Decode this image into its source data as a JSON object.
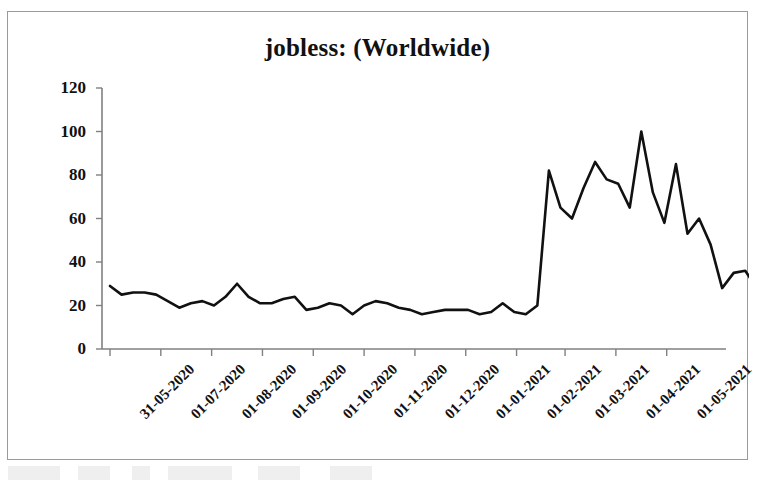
{
  "chart_data": {
    "type": "line",
    "title": "jobless: (Worldwide)",
    "xlabel": "",
    "ylabel": "",
    "ylim": [
      0,
      120
    ],
    "yticks": [
      0,
      20,
      40,
      60,
      80,
      100,
      120
    ],
    "grid": false,
    "legend": "none",
    "line_color": "#111111",
    "xtick_labels": [
      "31-05-2020",
      "01-07-2020",
      "01-08-2020",
      "01-09-2020",
      "01-10-2020",
      "01-11-2020",
      "01-12-2020",
      "01-01-2021",
      "01-02-2021",
      "01-03-2021",
      "01-04-2021",
      "01-05-2021"
    ],
    "xtick_positions": [
      0,
      4.4,
      8.8,
      13.2,
      17.6,
      22.0,
      26.4,
      30.8,
      35.2,
      39.4,
      43.8,
      48.2
    ],
    "x_index": [
      0,
      1,
      2,
      3,
      4,
      5,
      6,
      7,
      8,
      9,
      10,
      11,
      12,
      13,
      14,
      15,
      16,
      17,
      18,
      19,
      20,
      21,
      22,
      23,
      24,
      25,
      26,
      27,
      28,
      29,
      30,
      31,
      32,
      33,
      34,
      35,
      36,
      37,
      38,
      39,
      40,
      41,
      42,
      43,
      44,
      45,
      46,
      47,
      48,
      49,
      50,
      51,
      52,
      53
    ],
    "series": [
      {
        "name": "jobless",
        "values": [
          29,
          25,
          26,
          26,
          25,
          22,
          19,
          21,
          22,
          20,
          24,
          30,
          24,
          21,
          21,
          23,
          24,
          18,
          19,
          21,
          20,
          16,
          20,
          22,
          21,
          19,
          18,
          16,
          17,
          18,
          18,
          18,
          16,
          17,
          21,
          17,
          16,
          20,
          82,
          65,
          60,
          74,
          86,
          78,
          76,
          65,
          100,
          72,
          58,
          85,
          53,
          60,
          48,
          28,
          35,
          36,
          28
        ]
      }
    ]
  },
  "figure": {
    "background_color": "#ffffff",
    "frame_color": "#9a9a9a",
    "axis_color": "#808080"
  }
}
